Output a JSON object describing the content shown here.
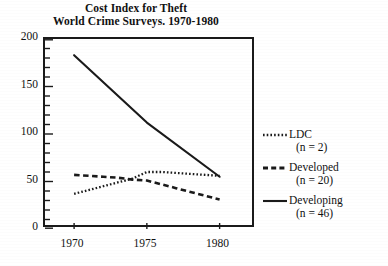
{
  "chart_data": {
    "type": "line",
    "title": "Cost Index for Theft",
    "subtitle": "World Crime Surveys. 1970-1980",
    "title_lines": [
      "Cost Index for Theft",
      "World Crime Surveys. 1970-1980"
    ],
    "xlabel": "",
    "ylabel": "",
    "x": [
      1970,
      1975,
      1980
    ],
    "xlim": [
      1968,
      1982.5
    ],
    "ylim": [
      0,
      200
    ],
    "xticks": [
      1970,
      1975,
      1980
    ],
    "xtick_labels": [
      "1970",
      "1975",
      "1980"
    ],
    "yticks": [
      0,
      50,
      100,
      150,
      200
    ],
    "ytick_labels": [
      "0",
      "50",
      "100",
      "150",
      "200"
    ],
    "y_minor_tick_step": 10,
    "grid": false,
    "legend_position": "right-outside",
    "series": [
      {
        "name": "LDC",
        "sublabel": "(n = 2)",
        "n": 2,
        "style": "dotted",
        "color": "#1a1a1a",
        "x": [
          1970,
          1971,
          1972,
          1973,
          1974,
          1975,
          1976,
          1977,
          1978,
          1979,
          1980
        ],
        "values": [
          37,
          41,
          45,
          49,
          53,
          60,
          60,
          59,
          58,
          57,
          56
        ]
      },
      {
        "name": "Developed",
        "sublabel": "(n = 20)",
        "n": 20,
        "style": "dashed",
        "color": "#1a1a1a",
        "x": [
          1970,
          1971,
          1972,
          1973,
          1974,
          1975,
          1976,
          1977,
          1978,
          1979,
          1980
        ],
        "values": [
          57,
          56,
          55,
          54,
          52,
          51,
          47,
          43,
          39,
          35,
          31
        ]
      },
      {
        "name": "Developing",
        "sublabel": "(n = 46)",
        "n": 46,
        "style": "solid",
        "color": "#1a1a1a",
        "x": [
          1970,
          1975,
          1980
        ],
        "values": [
          183,
          112,
          55
        ]
      }
    ]
  },
  "legend": {
    "entries": [
      {
        "label": "LDC",
        "sublabel": "(n = 2)",
        "icon": "dotted-line-icon"
      },
      {
        "label": "Developed",
        "sublabel": "(n = 20)",
        "icon": "dashed-line-icon"
      },
      {
        "label": "Developing",
        "sublabel": "(n = 46)",
        "icon": "solid-line-icon"
      }
    ]
  },
  "colors": {
    "ink": "#1a1a1a",
    "background": "#ffffff"
  }
}
